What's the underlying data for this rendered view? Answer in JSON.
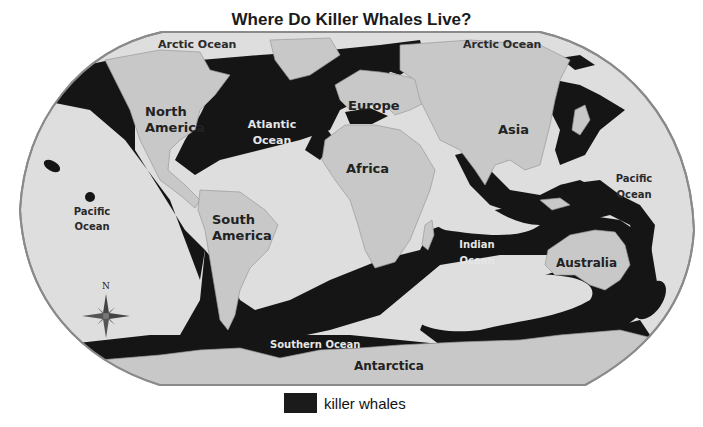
{
  "title": "Where Do Killer Whales Live?",
  "colors": {
    "ocean": "#dedede",
    "land": "#c8c8c8",
    "whale_range": "#151515",
    "border": "#8a8a8a",
    "dark_label": "#2a2a2a",
    "light_label": "#e6e6e6"
  },
  "labels": {
    "arctic_ocean_left": "Arctic Ocean",
    "arctic_ocean_right": "Arctic Ocean",
    "north_america_1": "North",
    "north_america_2": "America",
    "atlantic_1": "Atlantic",
    "atlantic_2": "Ocean",
    "europe": "Europe",
    "asia": "Asia",
    "africa": "Africa",
    "pacific_left_1": "Pacific",
    "pacific_left_2": "Ocean",
    "pacific_right_1": "Pacific",
    "pacific_right_2": "Ocean",
    "south_america_1": "South",
    "south_america_2": "America",
    "indian_1": "Indian",
    "indian_2": "Ocean",
    "australia": "Australia",
    "southern_ocean": "Southern Ocean",
    "antarctica": "Antarctica"
  },
  "compass": {
    "direction": "N"
  },
  "legend": {
    "label": "killer whales"
  }
}
